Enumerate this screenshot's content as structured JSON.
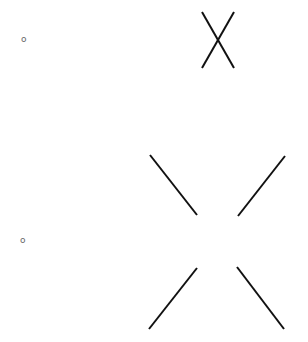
{
  "diagram": {
    "rows": [
      {
        "label": "o",
        "label_pos": {
          "x": 21,
          "y": 35
        },
        "lines": [
          {
            "x1": 202,
            "y1": 12,
            "x2": 234,
            "y2": 68
          },
          {
            "x1": 234,
            "y1": 12,
            "x2": 202,
            "y2": 68
          }
        ]
      },
      {
        "label": "o",
        "label_pos": {
          "x": 20,
          "y": 236
        },
        "lines": [
          {
            "x1": 150,
            "y1": 155,
            "x2": 197,
            "y2": 215
          },
          {
            "x1": 285,
            "y1": 156,
            "x2": 238,
            "y2": 216
          },
          {
            "x1": 197,
            "y1": 268,
            "x2": 149,
            "y2": 329
          },
          {
            "x1": 237,
            "y1": 267,
            "x2": 284,
            "y2": 329
          }
        ]
      }
    ],
    "stroke_color": "#111111",
    "stroke_width": 2
  }
}
